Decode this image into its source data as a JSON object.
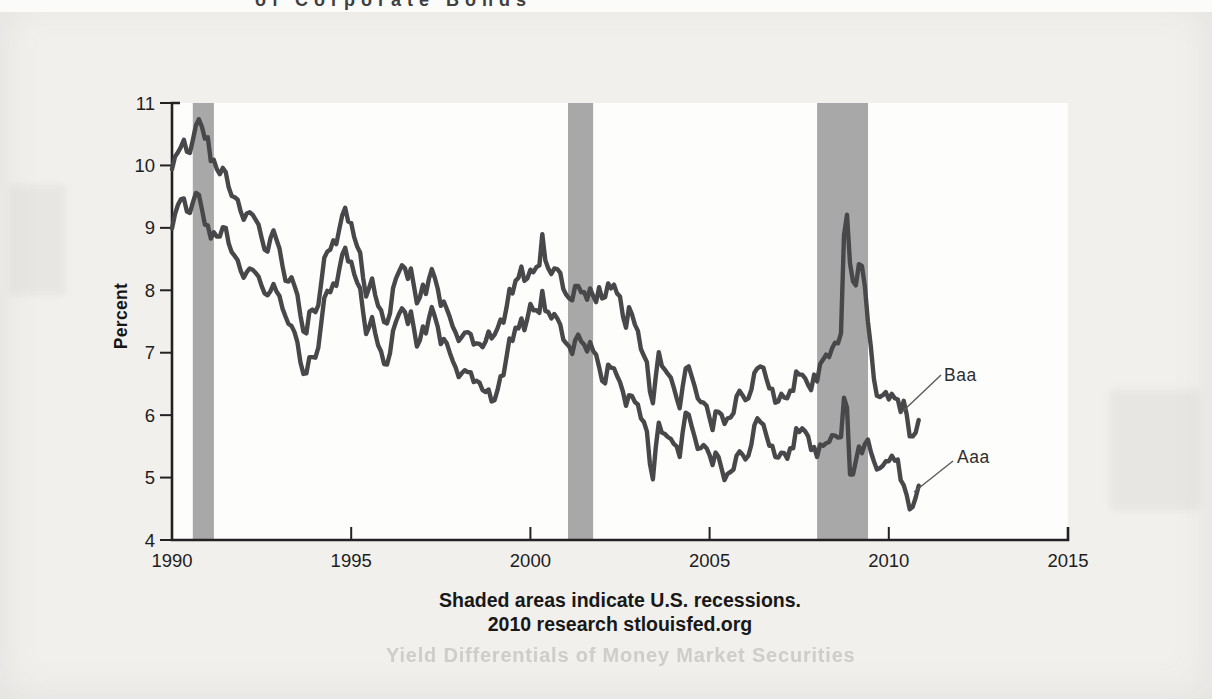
{
  "page": {
    "clipped_title_fragment": "of Corporate Bonds",
    "ghost_heading": "Yield Differentials of Money Market Securities"
  },
  "chart_data": {
    "type": "line",
    "ylabel": "Percent",
    "xlabel": "",
    "xlim": [
      1990,
      2015
    ],
    "ylim": [
      4,
      11
    ],
    "x_ticks": [
      1990,
      1995,
      2000,
      2005,
      2010,
      2015
    ],
    "y_ticks": [
      4,
      5,
      6,
      7,
      8,
      9,
      10,
      11
    ],
    "grid": false,
    "legend_position": "right-inline-labels",
    "recession_note": "Shaded areas indicate U.S. recessions.",
    "source_note": "2010 research stlouisfed.org",
    "recessions": [
      [
        1990.58,
        1991.17
      ],
      [
        2001.05,
        2001.75
      ],
      [
        2008.0,
        2009.42
      ]
    ],
    "x_start": 1990.0,
    "x_step_years": 0.0833333,
    "series": [
      {
        "name": "Baa",
        "values": [
          9.94,
          10.14,
          10.21,
          10.3,
          10.41,
          10.22,
          10.2,
          10.41,
          10.64,
          10.74,
          10.62,
          10.43,
          10.45,
          10.07,
          10.09,
          9.94,
          9.86,
          9.96,
          9.89,
          9.65,
          9.51,
          9.49,
          9.45,
          9.26,
          9.13,
          9.23,
          9.25,
          9.21,
          9.13,
          9.05,
          8.84,
          8.65,
          8.62,
          8.84,
          8.96,
          8.81,
          8.67,
          8.39,
          8.15,
          8.14,
          8.21,
          8.07,
          7.93,
          7.6,
          7.34,
          7.31,
          7.66,
          7.69,
          7.65,
          7.76,
          8.13,
          8.52,
          8.62,
          8.65,
          8.8,
          8.74,
          8.98,
          9.2,
          9.32,
          9.1,
          9.08,
          8.85,
          8.7,
          8.6,
          8.2,
          7.9,
          8.04,
          8.19,
          7.93,
          7.75,
          7.68,
          7.49,
          7.47,
          7.63,
          8.03,
          8.19,
          8.3,
          8.4,
          8.35,
          8.18,
          8.35,
          8.07,
          7.79,
          7.89,
          8.09,
          7.94,
          8.18,
          8.34,
          8.2,
          8.02,
          7.75,
          7.82,
          7.7,
          7.57,
          7.42,
          7.32,
          7.19,
          7.25,
          7.32,
          7.33,
          7.3,
          7.13,
          7.15,
          7.14,
          7.09,
          7.18,
          7.34,
          7.23,
          7.29,
          7.39,
          7.53,
          7.48,
          7.72,
          8.02,
          7.95,
          8.15,
          8.2,
          8.38,
          8.15,
          8.19,
          8.33,
          8.29,
          8.37,
          8.4,
          8.9,
          8.48,
          8.35,
          8.26,
          8.35,
          8.34,
          8.28,
          8.02,
          7.93,
          7.87,
          7.84,
          8.07,
          8.07,
          7.97,
          7.97,
          7.85,
          8.03,
          7.91,
          7.81,
          8.05,
          7.87,
          7.89,
          8.11,
          8.03,
          8.09,
          7.95,
          7.9,
          7.58,
          7.4,
          7.73,
          7.62,
          7.45,
          7.35,
          7.06,
          6.95,
          6.85,
          6.38,
          6.19,
          6.62,
          7.01,
          6.79,
          6.73,
          6.66,
          6.6,
          6.44,
          6.27,
          6.11,
          6.46,
          6.75,
          6.78,
          6.62,
          6.46,
          6.27,
          6.21,
          6.2,
          6.15,
          5.95,
          5.76,
          6.06,
          6.05,
          6.01,
          5.86,
          5.95,
          5.96,
          6.03,
          6.3,
          6.39,
          6.32,
          6.24,
          6.27,
          6.41,
          6.68,
          6.75,
          6.78,
          6.76,
          6.59,
          6.43,
          6.42,
          6.2,
          6.22,
          6.34,
          6.28,
          6.27,
          6.39,
          6.39,
          6.7,
          6.65,
          6.65,
          6.59,
          6.48,
          6.4,
          6.65,
          6.54,
          6.82,
          6.89,
          6.97,
          6.93,
          7.07,
          7.16,
          7.15,
          7.31,
          8.88,
          9.21,
          8.43,
          8.14,
          8.08,
          8.42,
          8.39,
          8.06,
          7.5,
          7.09,
          6.58,
          6.31,
          6.29,
          6.32,
          6.37,
          6.25,
          6.34,
          6.27,
          6.25,
          6.05,
          6.23,
          6.01,
          5.66,
          5.66,
          5.72,
          5.92
        ]
      },
      {
        "name": "Aaa",
        "values": [
          8.99,
          9.22,
          9.37,
          9.46,
          9.47,
          9.26,
          9.24,
          9.41,
          9.56,
          9.53,
          9.3,
          9.05,
          9.04,
          8.83,
          8.93,
          8.86,
          8.86,
          9.01,
          9.0,
          8.75,
          8.61,
          8.55,
          8.48,
          8.31,
          8.2,
          8.29,
          8.35,
          8.33,
          8.28,
          8.22,
          8.07,
          7.95,
          7.92,
          7.99,
          8.1,
          7.98,
          7.91,
          7.71,
          7.58,
          7.46,
          7.43,
          7.33,
          7.17,
          6.85,
          6.66,
          6.67,
          6.93,
          6.93,
          6.92,
          7.08,
          7.48,
          7.88,
          7.99,
          7.97,
          8.11,
          8.07,
          8.34,
          8.57,
          8.68,
          8.46,
          8.46,
          8.26,
          8.12,
          8.03,
          7.65,
          7.3,
          7.41,
          7.57,
          7.32,
          7.12,
          7.02,
          6.82,
          6.81,
          6.99,
          7.35,
          7.5,
          7.62,
          7.71,
          7.65,
          7.46,
          7.66,
          7.39,
          7.1,
          7.2,
          7.42,
          7.31,
          7.55,
          7.73,
          7.58,
          7.41,
          7.14,
          7.22,
          7.15,
          7.0,
          6.87,
          6.76,
          6.61,
          6.67,
          6.72,
          6.69,
          6.69,
          6.53,
          6.55,
          6.52,
          6.4,
          6.37,
          6.41,
          6.22,
          6.24,
          6.4,
          6.62,
          6.64,
          6.93,
          7.23,
          7.19,
          7.4,
          7.39,
          7.55,
          7.36,
          7.55,
          7.78,
          7.68,
          7.68,
          7.64,
          7.99,
          7.67,
          7.65,
          7.55,
          7.62,
          7.55,
          7.45,
          7.21,
          7.15,
          7.1,
          6.98,
          7.2,
          7.29,
          7.18,
          7.13,
          7.02,
          7.17,
          7.03,
          6.97,
          6.77,
          6.55,
          6.51,
          6.81,
          6.76,
          6.75,
          6.63,
          6.53,
          6.37,
          6.15,
          6.32,
          6.31,
          6.21,
          6.17,
          5.95,
          5.89,
          5.74,
          5.22,
          4.97,
          5.49,
          5.88,
          5.72,
          5.7,
          5.65,
          5.62,
          5.54,
          5.5,
          5.33,
          5.73,
          6.04,
          6.01,
          5.82,
          5.65,
          5.46,
          5.47,
          5.52,
          5.47,
          5.36,
          5.2,
          5.4,
          5.33,
          5.15,
          4.96,
          5.06,
          5.09,
          5.13,
          5.35,
          5.42,
          5.37,
          5.29,
          5.35,
          5.53,
          5.84,
          5.95,
          5.89,
          5.85,
          5.68,
          5.51,
          5.51,
          5.33,
          5.32,
          5.4,
          5.39,
          5.3,
          5.47,
          5.47,
          5.79,
          5.73,
          5.79,
          5.74,
          5.66,
          5.44,
          5.49,
          5.33,
          5.53,
          5.51,
          5.55,
          5.57,
          5.68,
          5.67,
          5.64,
          5.65,
          6.28,
          6.12,
          5.05,
          5.05,
          5.27,
          5.5,
          5.39,
          5.54,
          5.61,
          5.41,
          5.26,
          5.13,
          5.15,
          5.19,
          5.26,
          5.26,
          5.35,
          5.27,
          5.29,
          4.96,
          4.88,
          4.72,
          4.49,
          4.53,
          4.68,
          4.87
        ]
      }
    ],
    "colors": {
      "line": "#48484a",
      "recession_band": "#a8a8a8",
      "plot_bg": "#fdfdfc",
      "page_bg": "#f1f0ed",
      "text": "#1d1d1d",
      "leader_line": "#5a5a5a"
    }
  }
}
